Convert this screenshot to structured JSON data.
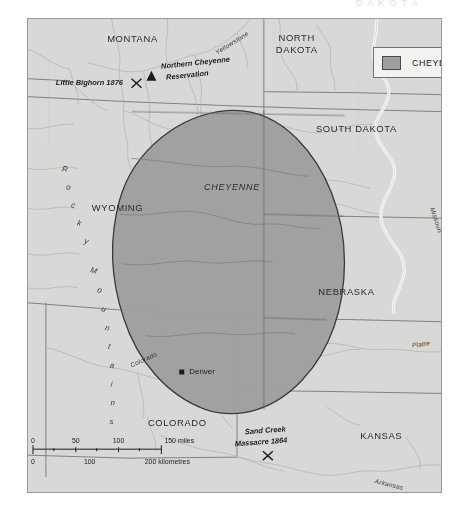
{
  "page": {
    "cut_header_text": "D A K O T A",
    "background_color": "#ffffff"
  },
  "map": {
    "land_color": "#d8d8d6",
    "territory_color": "#9e9e9c",
    "border_color": "#9a9a98",
    "river_color": "#f4f4f2",
    "state_line_color": "#6a6a68"
  },
  "legend": {
    "label": "CHEYENNE",
    "swatch_color": "#9e9e9c"
  },
  "states": [
    {
      "name": "MONTANA",
      "x": 105,
      "y": 23
    },
    {
      "name": "NORTH",
      "x": 270,
      "y": 22
    },
    {
      "name": "DAKOTA",
      "x": 270,
      "y": 34
    },
    {
      "name": "SOUTH DAKOTA",
      "x": 330,
      "y": 113
    },
    {
      "name": "WYOMING",
      "x": 90,
      "y": 193
    },
    {
      "name": "NEBRASKA",
      "x": 320,
      "y": 277
    },
    {
      "name": "COLORADO",
      "x": 150,
      "y": 409
    },
    {
      "name": "KANSAS",
      "x": 355,
      "y": 422
    }
  ],
  "territory": {
    "label": "CHEYENNE"
  },
  "mountains": {
    "label": "Rocky Mountains",
    "letters": [
      "R",
      "o",
      "c",
      "k",
      "y",
      "M",
      "o",
      "u",
      "n",
      "t",
      "a",
      "i",
      "n",
      "s"
    ]
  },
  "rivers": [
    {
      "name": "Yellowstone",
      "x": 190,
      "y": 36,
      "rotate": -32
    },
    {
      "name": "Missouri",
      "x": 412,
      "y": 196,
      "rotate": 72
    },
    {
      "name": "Platte",
      "x": 400,
      "y": 334,
      "rotate": -8
    },
    {
      "name": "Colorado",
      "x": 120,
      "y": 356,
      "rotate": -24
    },
    {
      "name": "Arkansas",
      "x": 360,
      "y": 470,
      "rotate": 14
    }
  ],
  "sites": [
    {
      "name": "Little Bighorn 1876",
      "label_x": 52,
      "label_y": 64,
      "marker": "x-cross",
      "marker_x": 131,
      "marker_y": 64
    },
    {
      "name": "Northern Cheyenne",
      "label_x": 156,
      "label_y": 55,
      "marker": "triangle",
      "marker_x": 148,
      "marker_y": 71
    },
    {
      "name": "Reservation",
      "label_x": 163,
      "label_y": 65,
      "marker": "none"
    },
    {
      "name": "Sand Creek",
      "label_x": 243,
      "label_y": 424,
      "marker": "none"
    },
    {
      "name": "Massacre 1864",
      "label_x": 236,
      "label_y": 435,
      "marker": "x-cross",
      "marker_x": 265,
      "marker_y": 452
    }
  ],
  "cities": [
    {
      "name": "Denver",
      "x": 186,
      "y": 375,
      "marker_x": 180,
      "marker_y": 375
    }
  ],
  "scale_bar": {
    "miles_ticks": [
      "0",
      "50",
      "100",
      "150 miles"
    ],
    "km_ticks": [
      "0",
      "100",
      "200 kilometres"
    ]
  }
}
